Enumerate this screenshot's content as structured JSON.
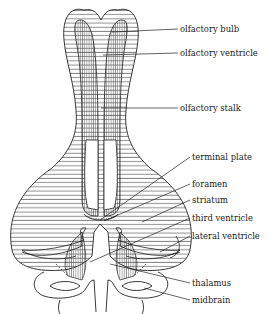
{
  "diagram": {
    "type": "anatomical-line-drawing",
    "ink_color": "#222222",
    "background": "#ffffff",
    "labels": [
      {
        "id": "olfactory-bulb",
        "text": "olfactory bulb",
        "x": 180,
        "y": 25,
        "target": [
          112,
          32
        ]
      },
      {
        "id": "olfactory-ventricle",
        "text": "olfactory ventricle",
        "x": 180,
        "y": 49,
        "target": [
          102,
          55
        ]
      },
      {
        "id": "olfactory-stalk",
        "text": "olfactory stalk",
        "x": 180,
        "y": 104,
        "target": [
          100,
          108
        ]
      },
      {
        "id": "terminal-plate",
        "text": "terminal plate",
        "x": 192,
        "y": 153,
        "target": [
          100,
          220
        ]
      },
      {
        "id": "foramen",
        "text": "foramen",
        "x": 192,
        "y": 180,
        "target": [
          100,
          219
        ]
      },
      {
        "id": "striatum",
        "text": "striatum",
        "x": 192,
        "y": 196,
        "target": [
          142,
          222
        ]
      },
      {
        "id": "third-ventricle",
        "text": "third ventricle",
        "x": 192,
        "y": 214,
        "target": [
          92,
          262
        ]
      },
      {
        "id": "lateral-ventricle",
        "text": "lateral ventricle",
        "x": 192,
        "y": 232,
        "target": [
          162,
          250
        ]
      },
      {
        "id": "thalamus",
        "text": "thalamus",
        "x": 192,
        "y": 279,
        "target": [
          110,
          264
        ]
      },
      {
        "id": "midbrain",
        "text": "midbrain",
        "x": 192,
        "y": 296,
        "target": [
          145,
          288
        ]
      }
    ]
  }
}
